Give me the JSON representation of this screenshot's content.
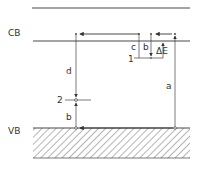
{
  "diagram": {
    "labels": {
      "conduction_band": "CB",
      "valence_band": "VB",
      "level_1": "1",
      "level_2": "2",
      "transition_a": "a",
      "transition_b_upper": "b",
      "transition_b_lower": "b",
      "transition_c": "c",
      "transition_d": "d",
      "delta_e": "ΔE"
    },
    "colors": {
      "line": "#333333",
      "background": "#ffffff"
    }
  }
}
